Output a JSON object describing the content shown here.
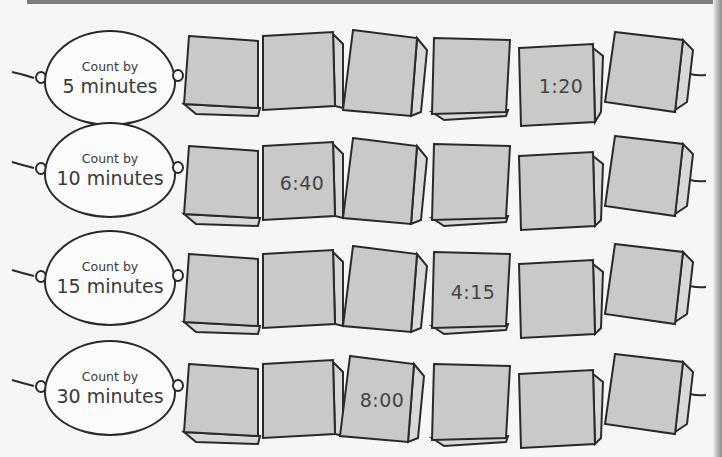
{
  "worksheet": {
    "rows": [
      {
        "label_line1": "Count by",
        "label_line2": "5 minutes",
        "beads": [
          "",
          "",
          "",
          "",
          "1:20",
          ""
        ]
      },
      {
        "label_line1": "Count by",
        "label_line2": "10 minutes",
        "beads": [
          "",
          "6:40",
          "",
          "",
          "",
          ""
        ]
      },
      {
        "label_line1": "Count by",
        "label_line2": "15 minutes",
        "beads": [
          "",
          "",
          "",
          "4:15",
          "",
          ""
        ]
      },
      {
        "label_line1": "Count by",
        "label_line2": "30 minutes",
        "beads": [
          "",
          "",
          "8:00",
          "",
          "",
          ""
        ]
      }
    ]
  },
  "colors": {
    "bead_fill": "#c9c9c9",
    "bead_side": "#d8d8d8",
    "outline": "#2a2a2a",
    "background": "#f6f6f4"
  }
}
